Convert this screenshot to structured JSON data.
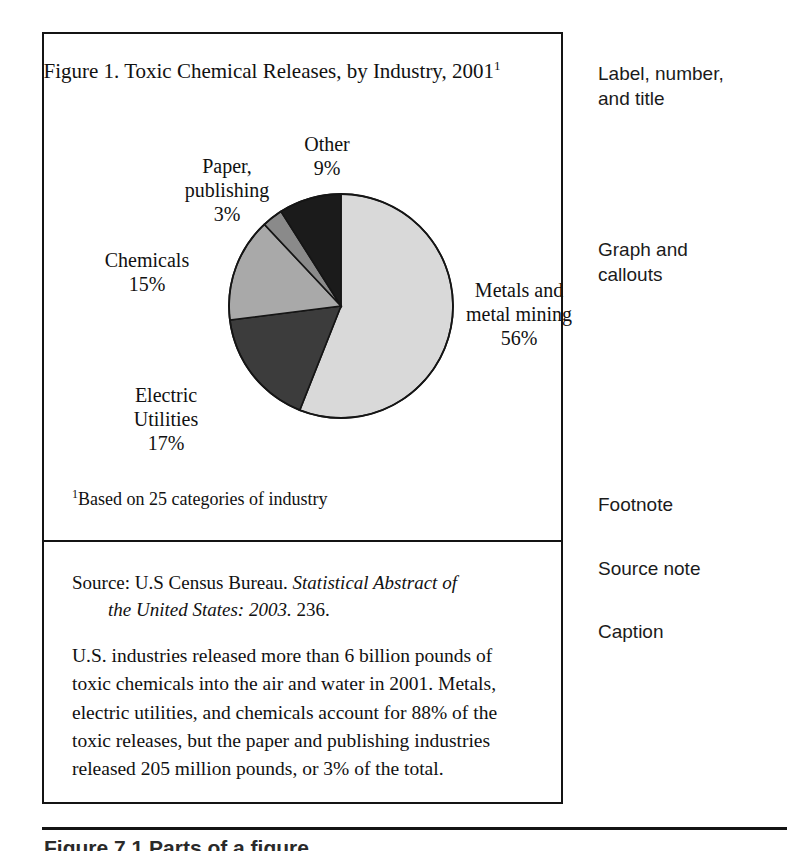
{
  "figure": {
    "title_main": "Figure 1.  Toxic Chemical Releases, by Industry, 2001",
    "title_superscript": "1",
    "footnote_superscript": "1",
    "footnote_text": "Based on 25 categories of industry",
    "source_prefix": "Source: U.S Census Bureau. ",
    "source_italic": "Statistical Abstract of",
    "source_italic_cont": "the United States:  2003.",
    "source_page": "  236.",
    "caption": "U.S. industries released more than 6 billion pounds of toxic chemicals into the air and water in 2001. Metals, electric utilities, and chemicals account for 88% of the toxic releases, but the paper and publishing industries released 205 million pounds, or 3% of the total."
  },
  "annotations": {
    "label": "Label, number,\nand title",
    "graph": "Graph and\ncallouts",
    "footnote": "Footnote",
    "source": "Source note",
    "caption": "Caption"
  },
  "page_bottom": {
    "cut_text": "Figure 7.1   Parts of a figure"
  },
  "chart_data": {
    "type": "pie",
    "title": "Figure 1.  Toxic Chemical Releases, by Industry, 2001",
    "xlabel": "",
    "ylabel": "",
    "grid": false,
    "legend": "callout labels placed around pie",
    "units": "percent of total toxic chemical releases",
    "start_angle_deg": 0,
    "direction": "clockwise",
    "categories": [
      "Metals and metal mining",
      "Electric Utilities",
      "Chemicals",
      "Paper, publishing",
      "Other"
    ],
    "values": [
      56,
      17,
      15,
      3,
      9
    ],
    "labels": [
      "56%",
      "17%",
      "15%",
      "3%",
      "9%"
    ],
    "colors": [
      "#d9d9d9",
      "#3c3c3c",
      "#a9a9a9",
      "#8a8a8a",
      "#1b1b1b"
    ],
    "slices": [
      {
        "name": "Metals and metal mining",
        "value": 56,
        "label": "56%",
        "color": "#d9d9d9",
        "callout": "Metals and\nmetal mining\n56%"
      },
      {
        "name": "Electric Utilities",
        "value": 17,
        "label": "17%",
        "color": "#3c3c3c",
        "callout": "Electric\nUtilities\n17%"
      },
      {
        "name": "Chemicals",
        "value": 15,
        "label": "15%",
        "color": "#a9a9a9",
        "callout": "Chemicals\n15%"
      },
      {
        "name": "Paper, publishing",
        "value": 3,
        "label": "3%",
        "color": "#8a8a8a",
        "callout": "Paper,\npublishing\n3%"
      },
      {
        "name": "Other",
        "value": 9,
        "label": "9%",
        "color": "#1b1b1b",
        "callout": "Other\n9%"
      }
    ],
    "callout_positions": [
      {
        "name": "Metals and metal mining",
        "left": 400,
        "top": 140,
        "width": 150
      },
      {
        "name": "Electric Utilities",
        "left": 52,
        "top": 245,
        "width": 140
      },
      {
        "name": "Chemicals",
        "left": 38,
        "top": 110,
        "width": 130
      },
      {
        "name": "Paper, publishing",
        "left": 118,
        "top": 16,
        "width": 130
      },
      {
        "name": "Other",
        "left": 228,
        "top": -6,
        "width": 110
      }
    ],
    "geometry": {
      "cx": 297,
      "cy": 168,
      "r": 112
    }
  }
}
